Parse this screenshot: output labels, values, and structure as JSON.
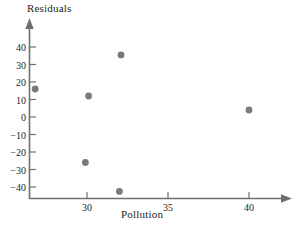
{
  "chart_data": {
    "type": "scatter",
    "title": "",
    "xlabel": "Pollution",
    "ylabel": "Residuals",
    "xlim": [
      26.0,
      42.5
    ],
    "ylim": [
      -48,
      46
    ],
    "grid": false,
    "legend": "none",
    "xticks": [
      30,
      35,
      40
    ],
    "xtick_labels": [
      "30",
      "35",
      "40"
    ],
    "yticks": [
      40,
      30,
      20,
      10,
      0,
      -10,
      -20,
      -30,
      -40
    ],
    "ytick_labels": [
      "40",
      "30",
      "20",
      "10",
      "0",
      "−10",
      "−20",
      "−30",
      "−40"
    ],
    "points": [
      {
        "x": 26.8,
        "y": 16
      },
      {
        "x": 30.1,
        "y": 12
      },
      {
        "x": 29.9,
        "y": -26
      },
      {
        "x": 32.1,
        "y": 35.5
      },
      {
        "x": 32.0,
        "y": -42.5
      },
      {
        "x": 40.0,
        "y": 4
      }
    ],
    "marker": {
      "shape": "circle",
      "color": "#7a7a7a",
      "size": 3.4
    },
    "axis_color": "#6f6f6f",
    "text_color": "#231f20"
  },
  "axes": {
    "y_title": "Residuals",
    "x_title": "Pollution"
  }
}
